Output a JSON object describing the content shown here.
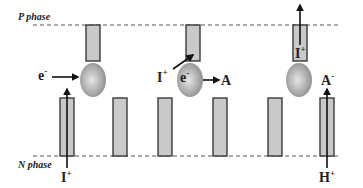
{
  "diagram": {
    "top_phase_label": "P phase",
    "bottom_phase_label": "N phase",
    "panels": [
      {
        "name": "panel-1",
        "labels": {
          "electron": "e",
          "electron_charge": "-",
          "ion_bottom": "I",
          "ion_bottom_charge": "+"
        }
      },
      {
        "name": "panel-2",
        "labels": {
          "ion": "I",
          "ion_charge": "+",
          "electron": "e",
          "electron_charge": "-",
          "acceptor": "A"
        }
      },
      {
        "name": "panel-3",
        "labels": {
          "ion_top": "I",
          "ion_top_charge": "+",
          "anion": "A",
          "anion_charge": "-",
          "proton": "H",
          "proton_charge": "+"
        }
      }
    ],
    "colors": {
      "bar_fill": "#c9c9c9",
      "ball_light": "#e6e6e6",
      "ball_dark": "#8a8a8a"
    }
  }
}
